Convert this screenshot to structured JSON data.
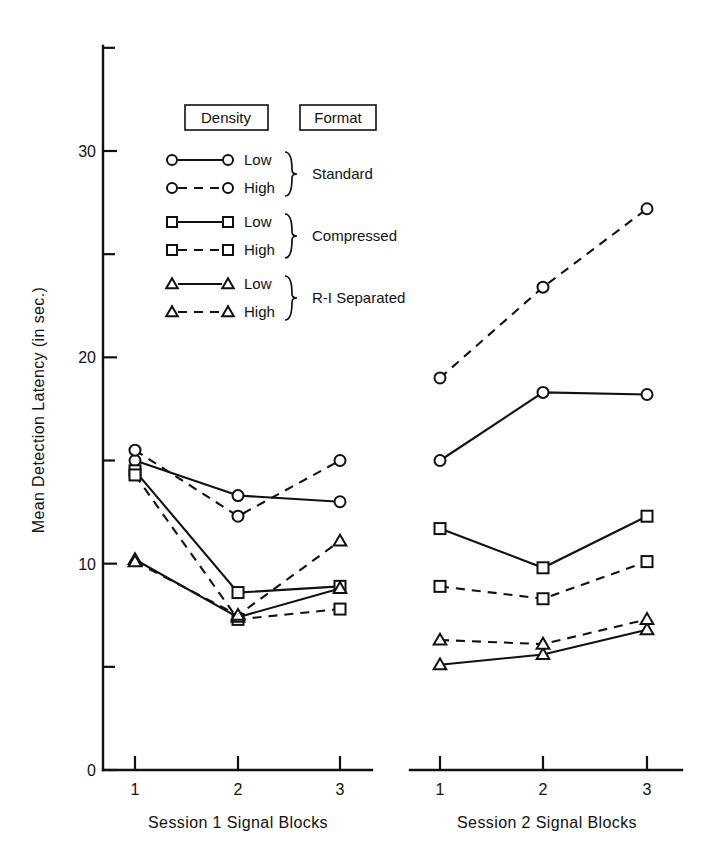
{
  "figure": {
    "ylabel": "Mean Detection Latency (in sec.)",
    "xlabel_left": "Session 1 Signal Blocks",
    "xlabel_right": "Session 2 Signal Blocks",
    "y_ticklabels": [
      "0",
      "10",
      "20",
      "30"
    ],
    "x_ticklabels": [
      "1",
      "2",
      "3"
    ]
  },
  "legend": {
    "header_density": "Density",
    "header_format": "Format",
    "rows": [
      {
        "density": "Low",
        "marker": "circle",
        "style": "solid"
      },
      {
        "density": "High",
        "marker": "circle",
        "style": "dashed"
      },
      {
        "density": "Low",
        "marker": "square",
        "style": "solid"
      },
      {
        "density": "High",
        "marker": "square",
        "style": "dashed"
      },
      {
        "density": "Low",
        "marker": "triangle",
        "style": "solid"
      },
      {
        "density": "High",
        "marker": "triangle",
        "style": "dashed"
      }
    ],
    "formats": [
      "Standard",
      "Compressed",
      "R-I Separated"
    ]
  },
  "chart_data": {
    "type": "line",
    "title": "",
    "xlabel": "Signal Blocks",
    "ylabel": "Mean Detection Latency (in sec.)",
    "ylim": [
      0,
      35
    ],
    "yticks": [
      0,
      10,
      20,
      30
    ],
    "yticks_minor": [
      5,
      15,
      25,
      35
    ],
    "grid": false,
    "legend_position": "upper-left",
    "panels": [
      {
        "name": "Session 1 Signal Blocks",
        "x": [
          1,
          2,
          3
        ],
        "series": [
          {
            "name": "Standard / Low",
            "format": "Standard",
            "density": "Low",
            "marker": "circle",
            "style": "solid",
            "values": [
              15.0,
              13.3,
              13.0
            ]
          },
          {
            "name": "Standard / High",
            "format": "Standard",
            "density": "High",
            "marker": "circle",
            "style": "dashed",
            "values": [
              15.5,
              12.3,
              15.0
            ]
          },
          {
            "name": "Compressed / Low",
            "format": "Compressed",
            "density": "Low",
            "marker": "square",
            "style": "solid",
            "values": [
              14.5,
              8.6,
              8.9
            ]
          },
          {
            "name": "Compressed / High",
            "format": "Compressed",
            "density": "High",
            "marker": "square",
            "style": "dashed",
            "values": [
              14.3,
              7.3,
              7.8
            ]
          },
          {
            "name": "R-I Separated / Low",
            "format": "R-I Separated",
            "density": "Low",
            "marker": "triangle",
            "style": "solid",
            "values": [
              10.2,
              7.4,
              8.8
            ]
          },
          {
            "name": "R-I Separated / High",
            "format": "R-I Separated",
            "density": "High",
            "marker": "triangle",
            "style": "dashed",
            "values": [
              10.1,
              7.5,
              11.1
            ]
          }
        ]
      },
      {
        "name": "Session 2 Signal Blocks",
        "x": [
          1,
          2,
          3
        ],
        "series": [
          {
            "name": "Standard / Low",
            "format": "Standard",
            "density": "Low",
            "marker": "circle",
            "style": "solid",
            "values": [
              15.0,
              18.3,
              18.2
            ]
          },
          {
            "name": "Standard / High",
            "format": "Standard",
            "density": "High",
            "marker": "circle",
            "style": "dashed",
            "values": [
              19.0,
              23.4,
              27.2
            ]
          },
          {
            "name": "Compressed / Low",
            "format": "Compressed",
            "density": "Low",
            "marker": "square",
            "style": "solid",
            "values": [
              11.7,
              9.8,
              12.3
            ]
          },
          {
            "name": "Compressed / High",
            "format": "Compressed",
            "density": "High",
            "marker": "square",
            "style": "dashed",
            "values": [
              8.9,
              8.3,
              10.1
            ]
          },
          {
            "name": "R-I Separated / Low",
            "format": "R-I Separated",
            "density": "Low",
            "marker": "triangle",
            "style": "solid",
            "values": [
              5.1,
              5.6,
              6.8
            ]
          },
          {
            "name": "R-I Separated / High",
            "format": "R-I Separated",
            "density": "High",
            "marker": "triangle",
            "style": "dashed",
            "values": [
              6.3,
              6.1,
              7.3
            ]
          }
        ]
      }
    ]
  }
}
